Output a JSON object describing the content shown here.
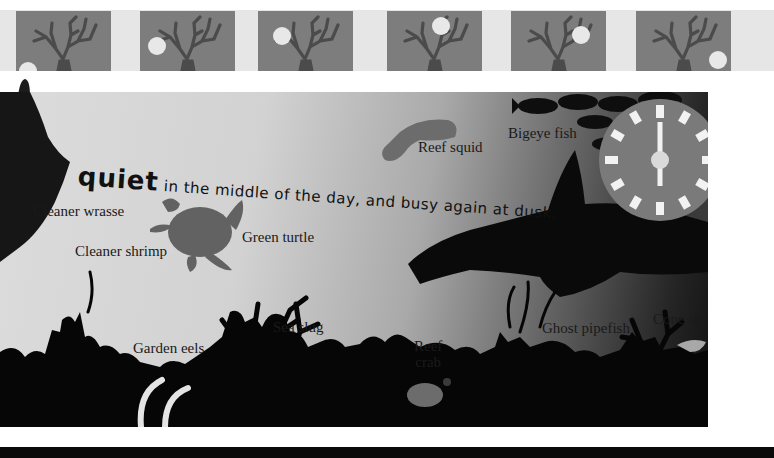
{
  "thumbnails": [
    {
      "index": 1,
      "sun_x": 12,
      "sun_y": 60,
      "label": "sun-position-dawn"
    },
    {
      "index": 2,
      "sun_x": 17,
      "sun_y": 35,
      "label": "sun-position-early-morning"
    },
    {
      "index": 3,
      "sun_x": 24,
      "sun_y": 25,
      "label": "sun-position-morning"
    },
    {
      "index": 4,
      "sun_x": 54,
      "sun_y": 15,
      "label": "sun-position-noon"
    },
    {
      "index": 5,
      "sun_x": 70,
      "sun_y": 24,
      "label": "sun-position-afternoon"
    },
    {
      "index": 6,
      "sun_x": 82,
      "sun_y": 49,
      "label": "sun-position-dusk"
    }
  ],
  "caption": {
    "emphasis": "quiet",
    "rest": " in the middle of the day, and busy again at dusk."
  },
  "labels": {
    "cleaner_wrasse": "Cleaner wrasse",
    "cleaner_shrimp": "Cleaner shrimp",
    "green_turtle": "Green turtle",
    "reef_squid": "Reef squid",
    "bigeye_fish": "Bigeye fish",
    "garden_eels": "Garden eels",
    "sea_slug": "Sea slug",
    "reef_crab_line1": "Reef",
    "reef_crab_line2": "crab",
    "ghost_pipefish": "Ghost pipefish",
    "cone_shell": "Cone shell"
  },
  "clock": {
    "time": "6:00",
    "hour_hand": "12",
    "minute_hand": "6",
    "face_color": "#7a7a7a",
    "mark_color": "#f2f2f2"
  },
  "colors": {
    "thumb_bg": "#7d7d7d",
    "coral": "#4a4a4a",
    "silhouette": "#0b0b0b",
    "animal_gray": "#6d6d6d"
  }
}
